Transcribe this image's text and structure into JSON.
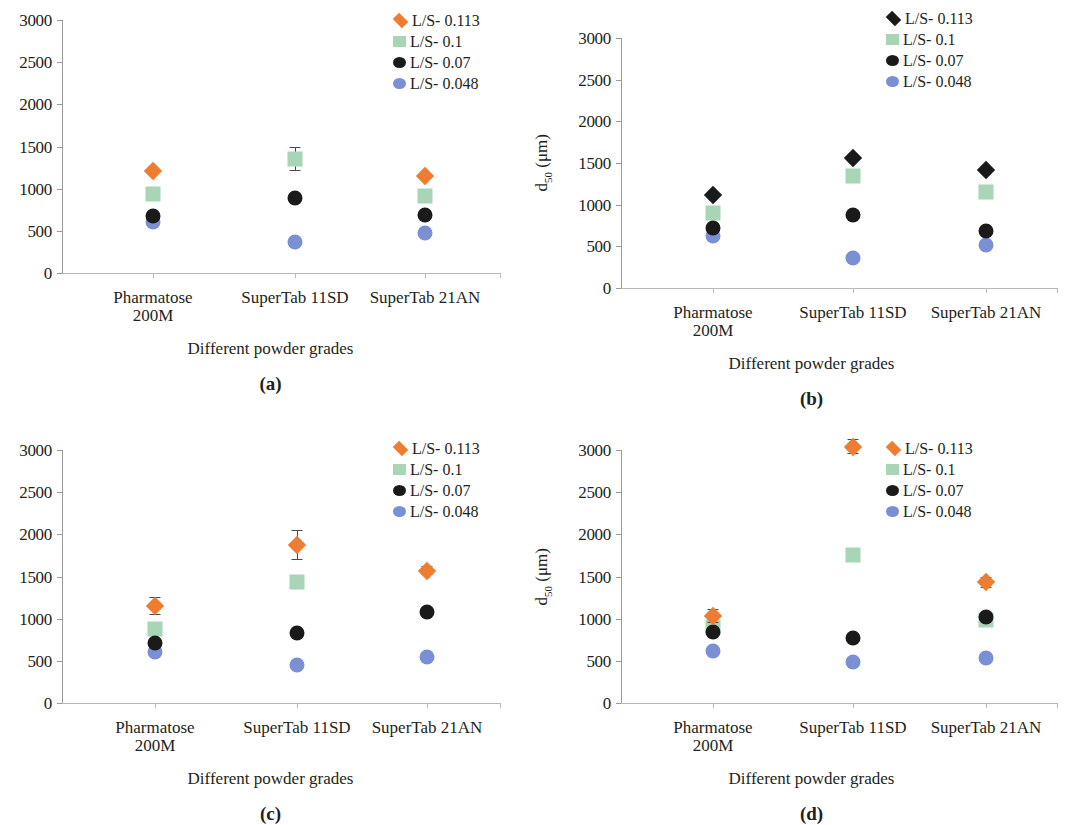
{
  "figure": {
    "categories": [
      "Pharmatose\n200M",
      "SuperTab 11SD",
      "SuperTab 21AN"
    ],
    "xtitle": "Different powder grades",
    "ylabel_main": "d",
    "ylabel_sub": "50",
    "ylabel_unit": " (μm)",
    "yticks": [
      "0",
      "500",
      "1000",
      "1500",
      "2000",
      "2500",
      "3000"
    ],
    "colors": {
      "orange": "#ED7D31",
      "green": "#A8D5B5",
      "black": "#1A1A1A",
      "blue": "#7B8FD4",
      "axis": "#9a9a9a",
      "error": "#4a4a4a"
    }
  },
  "chart_data": [
    {
      "type": "scatter",
      "panel": "(a)",
      "title": "",
      "xlabel": "Different powder grades",
      "ylabel": "d50 (μm)",
      "ylim": [
        0,
        3000
      ],
      "ytick_values": [
        0,
        500,
        1000,
        1500,
        2000,
        2500,
        3000
      ],
      "grid": false,
      "legend_position": "top-right",
      "categories": [
        "Pharmatose 200M",
        "SuperTab 11SD",
        "SuperTab 21AN"
      ],
      "series": [
        {
          "name": "L/S- 0.113",
          "marker": "diamond",
          "color": "#ED7D31",
          "values": [
            1210,
            null,
            1150
          ],
          "errors": [
            0,
            0,
            0
          ]
        },
        {
          "name": "L/S- 0.1",
          "marker": "square",
          "color": "#A8D5B5",
          "values": [
            935,
            1355,
            915
          ],
          "errors": [
            0,
            145,
            0
          ]
        },
        {
          "name": "L/S- 0.07",
          "marker": "circle",
          "color": "#1A1A1A",
          "values": [
            680,
            885,
            690
          ],
          "errors": [
            0,
            0,
            0
          ]
        },
        {
          "name": "L/S- 0.048",
          "marker": "circle",
          "color": "#7B8FD4",
          "values": [
            600,
            365,
            480
          ],
          "errors": [
            0,
            0,
            0
          ]
        }
      ]
    },
    {
      "type": "scatter",
      "panel": "(b)",
      "title": "",
      "xlabel": "Different powder grades",
      "ylabel": "d50 (μm)",
      "ylim": [
        0,
        3000
      ],
      "ytick_values": [
        0,
        500,
        1000,
        1500,
        2000,
        2500,
        3000
      ],
      "grid": false,
      "legend_position": "top-right",
      "categories": [
        "Pharmatose 200M",
        "SuperTab 11SD",
        "SuperTab 21AN"
      ],
      "series": [
        {
          "name": "L/S- 0.113",
          "marker": "diamond",
          "color": "#1A1A1A",
          "values": [
            1120,
            1560,
            1420
          ],
          "errors": [
            0,
            0,
            0
          ]
        },
        {
          "name": "L/S- 0.1",
          "marker": "square",
          "color": "#A8D5B5",
          "values": [
            895,
            1345,
            1155
          ],
          "errors": [
            0,
            0,
            0
          ]
        },
        {
          "name": "L/S- 0.07",
          "marker": "circle",
          "color": "#1A1A1A",
          "values": [
            725,
            880,
            680
          ],
          "errors": [
            0,
            0,
            0
          ]
        },
        {
          "name": "L/S- 0.048",
          "marker": "circle",
          "color": "#7B8FD4",
          "values": [
            620,
            365,
            520
          ],
          "errors": [
            0,
            0,
            0
          ]
        }
      ]
    },
    {
      "type": "scatter",
      "panel": "(c)",
      "title": "",
      "xlabel": "Different powder grades",
      "ylabel": "d50 (μm)",
      "ylim": [
        0,
        3000
      ],
      "ytick_values": [
        0,
        500,
        1000,
        1500,
        2000,
        2500,
        3000
      ],
      "grid": false,
      "legend_position": "top-right",
      "categories": [
        "Pharmatose 200M",
        "SuperTab 11SD",
        "SuperTab 21AN"
      ],
      "series": [
        {
          "name": "L/S- 0.113",
          "marker": "diamond",
          "color": "#ED7D31",
          "values": [
            1150,
            1870,
            1570
          ],
          "errors": [
            110,
            180,
            55
          ]
        },
        {
          "name": "L/S- 0.1",
          "marker": "square",
          "color": "#A8D5B5",
          "values": [
            880,
            1430,
            null
          ],
          "errors": [
            0,
            0,
            0
          ]
        },
        {
          "name": "L/S- 0.07",
          "marker": "circle",
          "color": "#1A1A1A",
          "values": [
            710,
            825,
            1075
          ],
          "errors": [
            0,
            0,
            0
          ]
        },
        {
          "name": "L/S- 0.048",
          "marker": "circle",
          "color": "#7B8FD4",
          "values": [
            600,
            450,
            540
          ],
          "errors": [
            0,
            0,
            0
          ]
        }
      ]
    },
    {
      "type": "scatter",
      "panel": "(d)",
      "title": "",
      "xlabel": "Different powder grades",
      "ylabel": "d50 (μm)",
      "ylim": [
        0,
        3000
      ],
      "ytick_values": [
        0,
        500,
        1000,
        1500,
        2000,
        2500,
        3000
      ],
      "grid": false,
      "legend_position": "top-right",
      "categories": [
        "Pharmatose 200M",
        "SuperTab 11SD",
        "SuperTab 21AN"
      ],
      "series": [
        {
          "name": "L/S- 0.113",
          "marker": "diamond",
          "color": "#ED7D31",
          "values": [
            1030,
            3040,
            1430
          ],
          "errors": [
            80,
            90,
            70
          ]
        },
        {
          "name": "L/S- 0.1",
          "marker": "square",
          "color": "#A8D5B5",
          "values": [
            900,
            1750,
            985
          ],
          "errors": [
            0,
            60,
            0
          ]
        },
        {
          "name": "L/S- 0.07",
          "marker": "circle",
          "color": "#1A1A1A",
          "values": [
            840,
            770,
            1025
          ],
          "errors": [
            0,
            0,
            0
          ]
        },
        {
          "name": "L/S- 0.048",
          "marker": "circle",
          "color": "#7B8FD4",
          "values": [
            615,
            485,
            530
          ],
          "errors": [
            0,
            0,
            0
          ]
        }
      ]
    }
  ]
}
